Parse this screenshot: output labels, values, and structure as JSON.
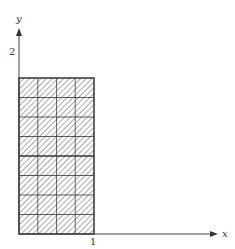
{
  "diagram": {
    "x_axis_label": "x",
    "y_axis_label": "y",
    "x_tick_label": "1",
    "y_tick_label": "2",
    "grid": {
      "columns": 4,
      "rows": 8,
      "thick_divider_after_row": 4
    },
    "colors": {
      "line": "#333333",
      "hatch": "#555555",
      "axis": "#444444"
    }
  }
}
